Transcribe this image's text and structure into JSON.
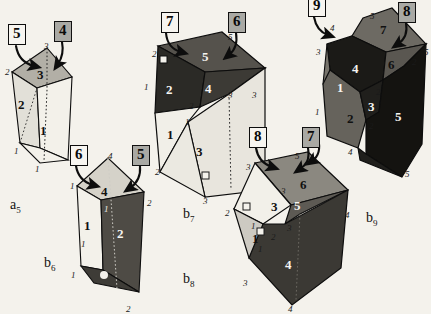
{
  "figure": {
    "background_color": "#f4f2ec",
    "ink_color": "#111111"
  },
  "palette": {
    "face_white": "#f3f1ea",
    "face_light": "#dedbd2",
    "face_mid": "#a8a59c",
    "face_dark": "#6e6b64",
    "face_black": "#1d1c1a",
    "outline": "#0d0d0d",
    "box_fill_gray": "#a9a9a4",
    "box_fill_white": "#f7f5f0"
  },
  "step_boxes": [
    {
      "id": "box-5-a5",
      "label": "5",
      "filled": false,
      "x": 8,
      "y": 24
    },
    {
      "id": "box-4-a5",
      "label": "4",
      "filled": true,
      "x": 54,
      "y": 21
    },
    {
      "id": "box-6-b6",
      "label": "6",
      "filled": false,
      "x": 70,
      "y": 145
    },
    {
      "id": "box-5-b6",
      "label": "5",
      "filled": true,
      "x": 132,
      "y": 145
    },
    {
      "id": "box-7-b7",
      "label": "7",
      "filled": false,
      "x": 161,
      "y": 12
    },
    {
      "id": "box-6-b7",
      "label": "6",
      "filled": true,
      "x": 228,
      "y": 12
    },
    {
      "id": "box-8-b8",
      "label": "8",
      "filled": false,
      "x": 249,
      "y": 127
    },
    {
      "id": "box-7-b8",
      "label": "7",
      "filled": true,
      "x": 302,
      "y": 127
    },
    {
      "id": "box-9-b9",
      "label": "9",
      "filled": false,
      "x": 308,
      "y": -4
    },
    {
      "id": "box-8-b9",
      "label": "8",
      "filled": true,
      "x": 398,
      "y": 2
    }
  ],
  "captions": [
    {
      "id": "caption-a5",
      "base": "a",
      "sub": "5",
      "x": 10,
      "y": 198
    },
    {
      "id": "caption-b6",
      "base": "b",
      "sub": "6",
      "x": 44,
      "y": 256
    },
    {
      "id": "caption-b7",
      "base": "b",
      "sub": "7",
      "x": 183,
      "y": 207
    },
    {
      "id": "caption-b8",
      "base": "b",
      "sub": "8",
      "x": 183,
      "y": 272
    },
    {
      "id": "caption-b9",
      "base": "b",
      "sub": "9",
      "x": 366,
      "y": 211
    }
  ],
  "solids": [
    {
      "id": "a5",
      "name": "polyhedron-a5",
      "face_numbers": [
        {
          "text": "3",
          "x": 37,
          "y": 68,
          "tone": "dark"
        },
        {
          "text": "2",
          "x": 18,
          "y": 98,
          "tone": "dark"
        },
        {
          "text": "1",
          "x": 40,
          "y": 124,
          "tone": "dark"
        }
      ],
      "edge_numbers": [
        {
          "text": "3",
          "x": 44,
          "y": 42
        },
        {
          "text": "2",
          "x": 5,
          "y": 68
        },
        {
          "text": "1",
          "x": 14,
          "y": 147
        },
        {
          "text": "1",
          "x": 35,
          "y": 165
        }
      ]
    },
    {
      "id": "b6",
      "name": "polyhedron-b6",
      "face_numbers": [
        {
          "text": "4",
          "x": 101,
          "y": 185,
          "tone": "dark"
        },
        {
          "text": "1",
          "x": 84,
          "y": 219,
          "tone": "dark"
        },
        {
          "text": "2",
          "x": 117,
          "y": 227,
          "tone": "light"
        }
      ],
      "edge_numbers": [
        {
          "text": "4",
          "x": 108,
          "y": 152
        },
        {
          "text": "1",
          "x": 70,
          "y": 182
        },
        {
          "text": "2",
          "x": 147,
          "y": 199
        },
        {
          "text": "1",
          "x": 104,
          "y": 205,
          "tone": "light"
        },
        {
          "text": "1",
          "x": 81,
          "y": 240
        },
        {
          "text": "1",
          "x": 71,
          "y": 271
        },
        {
          "text": "2",
          "x": 126,
          "y": 305
        }
      ]
    },
    {
      "id": "b7",
      "name": "polyhedron-b7",
      "face_numbers": [
        {
          "text": "5",
          "x": 202,
          "y": 50,
          "tone": "light"
        },
        {
          "text": "2",
          "x": 166,
          "y": 83,
          "tone": "light"
        },
        {
          "text": "4",
          "x": 205,
          "y": 82,
          "tone": "light"
        },
        {
          "text": "1",
          "x": 167,
          "y": 128,
          "tone": "dark"
        },
        {
          "text": "3",
          "x": 196,
          "y": 145,
          "tone": "dark"
        }
      ],
      "edge_numbers": [
        {
          "text": "5",
          "x": 228,
          "y": 33
        },
        {
          "text": "2",
          "x": 152,
          "y": 50
        },
        {
          "text": "1",
          "x": 144,
          "y": 83
        },
        {
          "text": "3",
          "x": 228,
          "y": 91
        },
        {
          "text": "3",
          "x": 252,
          "y": 91
        },
        {
          "text": "2",
          "x": 189,
          "y": 102
        },
        {
          "text": "1",
          "x": 185,
          "y": 118
        },
        {
          "text": "2",
          "x": 155,
          "y": 168
        },
        {
          "text": "3",
          "x": 203,
          "y": 197
        }
      ]
    },
    {
      "id": "b8",
      "name": "polyhedron-b8",
      "face_numbers": [
        {
          "text": "6",
          "x": 300,
          "y": 178,
          "tone": "dark"
        },
        {
          "text": "3",
          "x": 271,
          "y": 200,
          "tone": "dark"
        },
        {
          "text": "5",
          "x": 294,
          "y": 199,
          "tone": "light"
        },
        {
          "text": "1",
          "x": 252,
          "y": 232,
          "tone": "dark"
        },
        {
          "text": "4",
          "x": 285,
          "y": 258,
          "tone": "light"
        }
      ],
      "edge_numbers": [
        {
          "text": "5",
          "x": 295,
          "y": 152
        },
        {
          "text": "3",
          "x": 246,
          "y": 163
        },
        {
          "text": "3",
          "x": 281,
          "y": 187
        },
        {
          "text": "2",
          "x": 225,
          "y": 209
        },
        {
          "text": "4",
          "x": 345,
          "y": 211
        },
        {
          "text": "3",
          "x": 287,
          "y": 224
        },
        {
          "text": "1",
          "x": 251,
          "y": 222
        },
        {
          "text": "2",
          "x": 271,
          "y": 233
        },
        {
          "text": "1",
          "x": 258,
          "y": 245
        },
        {
          "text": "3",
          "x": 243,
          "y": 279
        },
        {
          "text": "4",
          "x": 288,
          "y": 305
        }
      ]
    },
    {
      "id": "b9",
      "name": "polyhedron-b9",
      "face_numbers": [
        {
          "text": "7",
          "x": 380,
          "y": 23,
          "tone": "dark"
        },
        {
          "text": "4",
          "x": 352,
          "y": 62,
          "tone": "light"
        },
        {
          "text": "6",
          "x": 388,
          "y": 58,
          "tone": "dark"
        },
        {
          "text": "1",
          "x": 337,
          "y": 81,
          "tone": "light"
        },
        {
          "text": "3",
          "x": 368,
          "y": 100,
          "tone": "light"
        },
        {
          "text": "2",
          "x": 347,
          "y": 112,
          "tone": "dark"
        },
        {
          "text": "5",
          "x": 395,
          "y": 110,
          "tone": "light"
        }
      ],
      "edge_numbers": [
        {
          "text": "5",
          "x": 370,
          "y": 12
        },
        {
          "text": "4",
          "x": 330,
          "y": 24
        },
        {
          "text": "3",
          "x": 316,
          "y": 48
        },
        {
          "text": "5",
          "x": 424,
          "y": 48
        },
        {
          "text": "2",
          "x": 412,
          "y": 58
        },
        {
          "text": "2",
          "x": 376,
          "y": 88
        },
        {
          "text": "1",
          "x": 315,
          "y": 108
        },
        {
          "text": "2",
          "x": 369,
          "y": 122
        },
        {
          "text": "4",
          "x": 348,
          "y": 148
        },
        {
          "text": "5",
          "x": 405,
          "y": 170
        }
      ]
    }
  ],
  "right_angle_markers": [
    {
      "id": "ra-b7-top",
      "x": 160,
      "y": 56
    },
    {
      "id": "ra-b7-bot",
      "x": 202,
      "y": 172
    },
    {
      "id": "ra-b6",
      "x": 101,
      "y": 272,
      "filled": true
    },
    {
      "id": "ra-b8-left",
      "x": 243,
      "y": 203
    },
    {
      "id": "ra-b8-mid",
      "x": 258,
      "y": 231
    }
  ]
}
